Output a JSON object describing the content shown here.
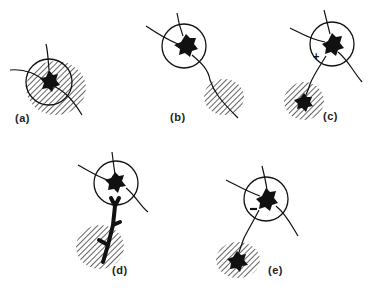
{
  "figure": {
    "type": "neuron-receptive-field-schematic",
    "panels": [
      {
        "id": "a",
        "label": "(a)",
        "description": "Neuron soma inside circle, hatched field overlapping circle"
      },
      {
        "id": "b",
        "label": "(b)",
        "description": "Neuron in circle with axon extending to separate hatched field"
      },
      {
        "id": "c",
        "label": "(c)",
        "description": "Excitatory (+) input from neuron in hatched field",
        "sign": "+"
      },
      {
        "id": "d",
        "label": "(d)",
        "description": "Neuron with thick branched dendrite extending into hatched field"
      },
      {
        "id": "e",
        "label": "(e)",
        "description": "Inhibitory (−) input from neuron in hatched field",
        "sign": "−"
      }
    ],
    "colors": {
      "ink": "#111111",
      "background": "#ffffff"
    }
  }
}
